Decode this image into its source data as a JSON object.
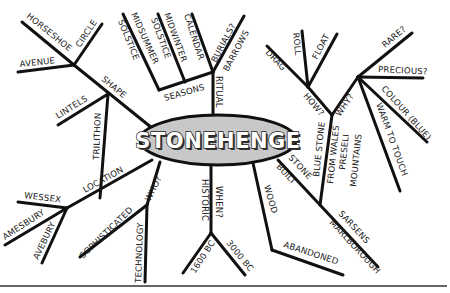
{
  "diagram": {
    "type": "mind-map",
    "center": {
      "label": "STONEHENGE",
      "fill": "#c8c8c8",
      "stroke": "#111111"
    },
    "branches": [
      {
        "label": "SHAPE",
        "children": [
          {
            "label": "HORSESHOE"
          },
          {
            "label": "CIRCLE"
          },
          {
            "label": "AVENUE"
          },
          {
            "label": "LINTELS"
          },
          {
            "label": "TRILITHON"
          }
        ]
      },
      {
        "label": "RITUAL",
        "children": [
          {
            "label": "SEASONS",
            "children": [
              {
                "label": "MIDSUMMER SOLSTICE"
              },
              {
                "label": "MIDWINTER SOLSTICE"
              }
            ]
          },
          {
            "label": "CALENDAR"
          },
          {
            "label": "BURIALS? BARROWS"
          }
        ]
      },
      {
        "label": "STONE BUILT",
        "children": [
          {
            "label": "BLUE STONE",
            "children": [
              {
                "label": "HOW?",
                "children": [
                  {
                    "label": "DRAG"
                  },
                  {
                    "label": "ROLL"
                  },
                  {
                    "label": "FLOAT"
                  }
                ]
              },
              {
                "label": "WHY?",
                "children": [
                  {
                    "label": "RARE?"
                  },
                  {
                    "label": "PRECIOUS?"
                  },
                  {
                    "label": "COLOUR (BLUE)"
                  },
                  {
                    "label": "WARM TO TOUCH"
                  }
                ]
              },
              {
                "label": "FROM WALES PRESELI MOUNTAINS"
              }
            ]
          },
          {
            "label": "SARSENS",
            "children": [
              {
                "label": "MARLBOROUGH"
              }
            ]
          }
        ]
      },
      {
        "label": "WOOD",
        "children": [
          {
            "label": "ABANDONED"
          }
        ]
      },
      {
        "label": "HISTORIC",
        "children": [
          {
            "label": "WHEN?",
            "children": [
              {
                "label": "1600 BC"
              },
              {
                "label": "3000 BC"
              }
            ]
          }
        ]
      },
      {
        "label": "WHO?",
        "children": [
          {
            "label": "SOPHISTICATED"
          },
          {
            "label": "TECHNOLOGY"
          }
        ]
      },
      {
        "label": "LOCATION",
        "children": [
          {
            "label": "WESSEX"
          },
          {
            "label": "AMESBURY"
          },
          {
            "label": "AVEBURY"
          }
        ]
      }
    ]
  },
  "labels": {
    "center": "STONEHENGE",
    "shape": "SHAPE",
    "horseshoe": "HORSESHOE",
    "circle": "CIRCLE",
    "avenue": "AVENUE",
    "lintels": "LINTELS",
    "trilithon": "TRILITHON",
    "seasons": "SEASONS",
    "ritual": "RITUAL",
    "midsummer": "MIDSUMMER",
    "solstice1": "SOLSTICE",
    "midwinter": "MIDWINTER",
    "solstice2": "SOLSTICE",
    "calendar": "CALENDAR",
    "burials": "BURIALS?",
    "barrows": "BARROWS",
    "drag": "DRAG",
    "roll": "ROLL",
    "float": "FLOAT",
    "how": "HOW?",
    "why": "WHY?",
    "rare": "RARE?",
    "precious": "PRECIOUS?",
    "colour": "COLOUR (BLUE)",
    "warm": "WARM TO TOUCH",
    "bluestone": "BLUE STONE",
    "fromwales": "FROM WALES",
    "preseli": "PRESELI",
    "mountains": "MOUNTAINS",
    "stone": "STONE",
    "built": "BUILT",
    "sarsens": "SARSENS",
    "marlborough": "MARLBOROUGH",
    "wood": "WOOD",
    "abandoned": "ABANDONED",
    "historic": "HISTORIC",
    "when": "WHEN?",
    "bc1600": "1600 BC",
    "bc3000": "3000 BC",
    "who": "WHO?",
    "sophisticated": "SOPHISTICATED",
    "technology": "TECHNOLOGY",
    "location": "LOCATION",
    "wessex": "WESSEX",
    "amesbury": "AMESBURY",
    "avebury": "AVEBURY"
  }
}
